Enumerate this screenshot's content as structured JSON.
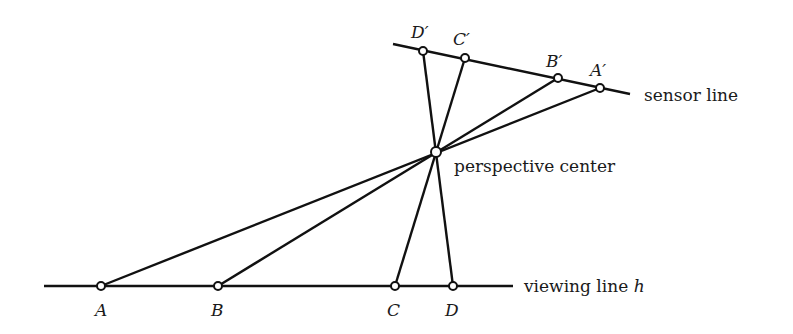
{
  "diagram": {
    "type": "perspective projection",
    "lines": {
      "sensor": {
        "label": "sensor line",
        "from": [
          393,
          44
        ],
        "to": [
          630,
          94
        ]
      },
      "viewing": {
        "label": "viewing line ",
        "label_var": "h",
        "from": [
          44,
          286
        ],
        "to": [
          513,
          286
        ]
      }
    },
    "center": {
      "label": "perspective center",
      "pos": [
        436,
        152
      ]
    },
    "points": [
      {
        "name": "A",
        "pos": [
          101,
          286
        ],
        "image": "A′",
        "image_pos": [
          600,
          88
        ]
      },
      {
        "name": "B",
        "pos": [
          218,
          286
        ],
        "image": "B′",
        "image_pos": [
          558,
          78
        ]
      },
      {
        "name": "C",
        "pos": [
          395,
          286
        ],
        "image": "C′",
        "image_pos": [
          465,
          58
        ]
      },
      {
        "name": "D",
        "pos": [
          453,
          286
        ],
        "image": "D′",
        "image_pos": [
          423,
          51
        ]
      }
    ]
  },
  "labels": {
    "A": "A",
    "B": "B",
    "C": "C",
    "D": "D",
    "Ap": "A′",
    "Bp": "B′",
    "Cp": "C′",
    "Dp": "D′",
    "sensor": "sensor line",
    "center": "perspective center",
    "viewing": "viewing line ",
    "viewing_var": "h"
  }
}
